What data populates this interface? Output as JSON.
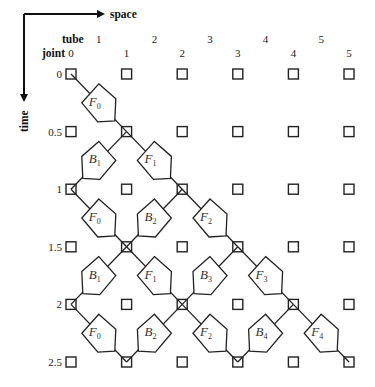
{
  "axes": {
    "space_label": "space",
    "time_label": "time",
    "tube_header": "tube",
    "joint_header": "joint"
  },
  "tube_labels": [
    "1",
    "2",
    "3",
    "4",
    "5"
  ],
  "joint_labels": [
    "0",
    "1",
    "2",
    "3",
    "4",
    "5"
  ],
  "time_labels": [
    "0",
    "0.5",
    "1",
    "1.5",
    "2",
    "2.5"
  ],
  "pentagons": [
    {
      "type": "F",
      "index": "0",
      "row": 0,
      "from_col": 0,
      "to_col": 1
    },
    {
      "type": "B",
      "index": "1",
      "row": 1,
      "from_col": 1,
      "to_col": 0
    },
    {
      "type": "F",
      "index": "1",
      "row": 1,
      "from_col": 1,
      "to_col": 2
    },
    {
      "type": "F",
      "index": "0",
      "row": 2,
      "from_col": 0,
      "to_col": 1
    },
    {
      "type": "B",
      "index": "2",
      "row": 2,
      "from_col": 2,
      "to_col": 1
    },
    {
      "type": "F",
      "index": "2",
      "row": 2,
      "from_col": 2,
      "to_col": 3
    },
    {
      "type": "B",
      "index": "1",
      "row": 3,
      "from_col": 1,
      "to_col": 0
    },
    {
      "type": "F",
      "index": "1",
      "row": 3,
      "from_col": 1,
      "to_col": 2
    },
    {
      "type": "B",
      "index": "3",
      "row": 3,
      "from_col": 3,
      "to_col": 2
    },
    {
      "type": "F",
      "index": "3",
      "row": 3,
      "from_col": 3,
      "to_col": 4
    },
    {
      "type": "F",
      "index": "0",
      "row": 4,
      "from_col": 0,
      "to_col": 1
    },
    {
      "type": "B",
      "index": "2",
      "row": 4,
      "from_col": 2,
      "to_col": 1
    },
    {
      "type": "F",
      "index": "2",
      "row": 4,
      "from_col": 2,
      "to_col": 3
    },
    {
      "type": "B",
      "index": "4",
      "row": 4,
      "from_col": 4,
      "to_col": 3
    },
    {
      "type": "F",
      "index": "4",
      "row": 4,
      "from_col": 4,
      "to_col": 5
    }
  ]
}
